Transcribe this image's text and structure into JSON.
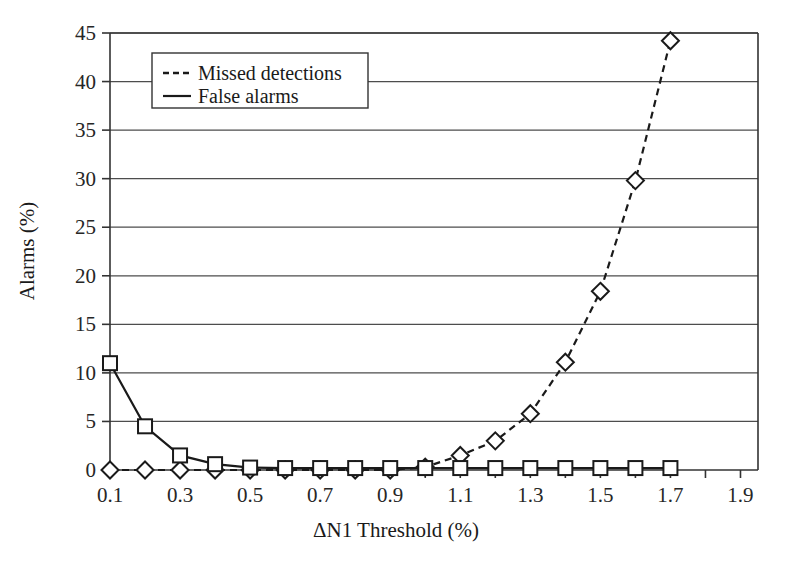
{
  "chart_data": {
    "type": "line",
    "title": "",
    "xlabel": "ΔN1 Threshold (%)",
    "ylabel": "Alarms (%)",
    "xlim": [
      0.1,
      1.95
    ],
    "ylim": [
      0,
      45
    ],
    "grid": "horizontal",
    "legend_position": "upper-left-inside",
    "x": [
      0.1,
      0.2,
      0.3,
      0.4,
      0.5,
      0.6,
      0.7,
      0.8,
      0.9,
      1.0,
      1.1,
      1.2,
      1.3,
      1.4,
      1.5,
      1.6,
      1.7
    ],
    "xticks": [
      0.1,
      0.2,
      0.3,
      0.4,
      0.5,
      0.6,
      0.7,
      0.8,
      0.9,
      1.0,
      1.1,
      1.2,
      1.3,
      1.4,
      1.5,
      1.6,
      1.7,
      1.8,
      1.9
    ],
    "xtick_labels": [
      "0.1",
      "",
      "0.3",
      "",
      "0.5",
      "",
      "0.7",
      "",
      "0.9",
      "",
      "1.1",
      "",
      "1.3",
      "",
      "1.5",
      "",
      "1.7",
      "",
      "1.9"
    ],
    "yticks": [
      0,
      5,
      10,
      15,
      20,
      25,
      30,
      35,
      40,
      45
    ],
    "ytick_labels": [
      "0",
      "5",
      "10",
      "15",
      "20",
      "25",
      "30",
      "35",
      "40",
      "45"
    ],
    "series": [
      {
        "name": "Missed detections",
        "style": "dashed",
        "marker": "diamond",
        "color": "#1a1a1a",
        "values": [
          0,
          0,
          0,
          0,
          0,
          0,
          0,
          0,
          0,
          0.3,
          1.5,
          3.0,
          5.8,
          11.1,
          18.4,
          29.8,
          44.2
        ]
      },
      {
        "name": "False alarms",
        "style": "solid",
        "marker": "square",
        "color": "#1a1a1a",
        "values": [
          11.0,
          4.5,
          1.5,
          0.6,
          0.25,
          0.2,
          0.2,
          0.2,
          0.2,
          0.2,
          0.2,
          0.2,
          0.2,
          0.2,
          0.2,
          0.2,
          0.2
        ]
      }
    ]
  },
  "legend": {
    "entries": [
      {
        "label": "Missed detections",
        "style": "dashed"
      },
      {
        "label": "False alarms",
        "style": "solid"
      }
    ]
  },
  "colors": {
    "axis": "#333333",
    "grid": "#4d4d4d",
    "series": "#1a1a1a",
    "background": "#ffffff"
  }
}
